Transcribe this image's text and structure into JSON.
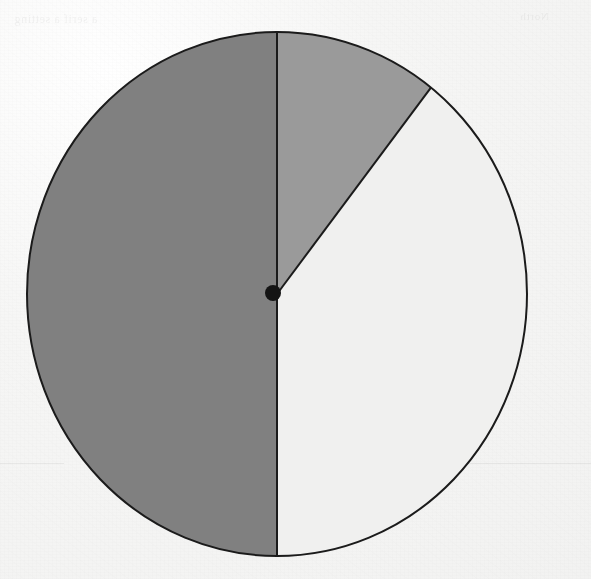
{
  "page": {
    "background_color": "#f7f7f6",
    "media": "scanned-paper"
  },
  "ghost_marks": {
    "top_left_text": "a serif a setting",
    "top_right_text": "North",
    "middle_text": "which area",
    "rule_color": "#e8e8e8"
  },
  "chart_data": {
    "type": "pie",
    "title": "",
    "subtitle": "",
    "xlabel": "",
    "ylabel": "",
    "legend": "none",
    "grid": false,
    "center": {
      "x": 277,
      "y": 294
    },
    "radius_x": 250,
    "radius_y": 262,
    "start_angle_deg": 0,
    "direction": "clockwise",
    "outline_color": "#1b1b1b",
    "outline_width": 2,
    "center_dot": {
      "visible": true,
      "x": 273,
      "y": 293,
      "radius": 8,
      "color": "#141414"
    },
    "categories": [
      "Sector A",
      "Sector B",
      "Sector C"
    ],
    "values": [
      10.5,
      39.5,
      50.0
    ],
    "angles_deg": [
      38,
      142,
      180
    ],
    "colors": [
      "#9a9a9a",
      "#f0f0ef",
      "#808080"
    ],
    "slices": [
      {
        "label": "Sector A",
        "value": 10.5,
        "angle_deg": 38,
        "start_deg": 0,
        "end_deg": 38,
        "color": "#9a9a9a",
        "shade": "medium-gray"
      },
      {
        "label": "Sector B",
        "value": 39.5,
        "angle_deg": 142,
        "start_deg": 38,
        "end_deg": 180,
        "color": "#f0f0ef",
        "shade": "light-gray"
      },
      {
        "label": "Sector C",
        "value": 50.0,
        "angle_deg": 180,
        "start_deg": 180,
        "end_deg": 360,
        "color": "#808080",
        "shade": "dark-gray"
      }
    ],
    "ylim": [
      0,
      100
    ]
  }
}
